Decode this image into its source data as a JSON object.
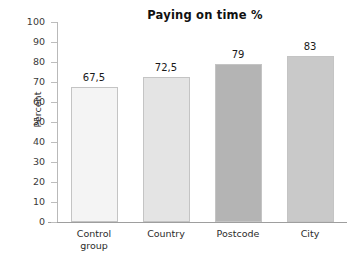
{
  "chart_data": {
    "type": "bar",
    "title": "Paying on time %",
    "xlabel": "",
    "ylabel": "Percent",
    "categories": [
      "Control group",
      "Country",
      "Postcode",
      "City"
    ],
    "values": [
      67.5,
      72.5,
      79,
      83
    ],
    "value_labels": [
      "67,5",
      "72,5",
      "79",
      "83"
    ],
    "category_lines": [
      [
        "Control",
        "group"
      ],
      [
        "Country"
      ],
      [
        "Postcode"
      ],
      [
        "City"
      ]
    ],
    "ylim": [
      0,
      100
    ],
    "ytick_step": 10,
    "ytick_labels": [
      "100",
      "90",
      "80",
      "70",
      "60",
      "50",
      "40",
      "30",
      "20",
      "10",
      "0"
    ],
    "ytick_values": [
      100,
      90,
      80,
      70,
      60,
      50,
      40,
      30,
      20,
      10,
      0
    ],
    "grid": false,
    "legend": false,
    "bar_colors": [
      "#F4F4F4",
      "#E4E4E4",
      "#B4B4B4",
      "#C9C9C9"
    ],
    "bar_border_color": "#C4C4C4",
    "axis_color": "#B9B9B9",
    "background": "#FFFFFF"
  }
}
